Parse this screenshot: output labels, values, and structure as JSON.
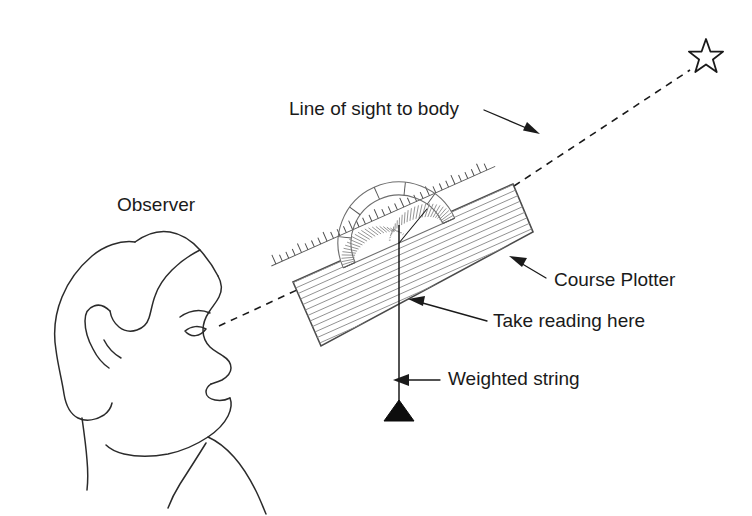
{
  "figure": {
    "background_color": "#ffffff",
    "ink_color": "#1a1a1a",
    "width": 752,
    "height": 516
  },
  "labels": {
    "line_of_sight": "Line of sight to body",
    "observer": "Observer",
    "course_plotter": "Course Plotter",
    "take_reading_here": "Take reading here",
    "weighted_string": "Weighted string"
  },
  "elements": {
    "star": {
      "name": "celestial-body-star",
      "points": 5,
      "center": [
        706,
        57
      ],
      "outer_radius": 18,
      "inner_radius": 7.6
    },
    "observer_head": {
      "name": "observer-head-profile",
      "eye_position": [
        203,
        333
      ],
      "facing": "right"
    },
    "course_plotter": {
      "name": "course-plotter",
      "corners": [
        [
          293,
          282
        ],
        [
          513,
          184
        ],
        [
          533,
          232
        ],
        [
          321,
          346
        ]
      ],
      "rotation_deg": -24,
      "hatch_count": 19,
      "edge_tick_count": 34
    },
    "protractor": {
      "name": "protractor-scale",
      "center": [
        399,
        243
      ],
      "outer_radius": 61,
      "inner_radius": 48,
      "minor_tick_count": 72,
      "sweep": "semicircle"
    },
    "plumb": {
      "name": "weighted-string",
      "top": [
        399,
        226
      ],
      "bottom": [
        399,
        402
      ],
      "weight_apex": [
        399,
        421
      ],
      "weight_half_width": 15
    },
    "sight_line": {
      "name": "line-of-sight-dashed",
      "from": [
        218,
        326
      ],
      "via": [
        296,
        290
      ],
      "to": [
        690,
        70
      ],
      "style": "dashed"
    }
  },
  "leaders": [
    {
      "name": "leader-line-of-sight",
      "label_anchor": [
        290,
        110
      ],
      "start": [
        485,
        110
      ],
      "end": [
        534,
        132
      ]
    },
    {
      "name": "leader-course-plotter",
      "label_anchor": [
        553,
        281
      ],
      "start": [
        545,
        278
      ],
      "end": [
        512,
        258
      ]
    },
    {
      "name": "leader-take-reading",
      "label_anchor": [
        492,
        322
      ],
      "start": [
        485,
        320
      ],
      "end": [
        410,
        299
      ]
    },
    {
      "name": "leader-weighted-string",
      "label_anchor": [
        447,
        380
      ],
      "start": [
        440,
        380
      ],
      "end": [
        394,
        380
      ]
    }
  ],
  "label_positions": {
    "line_of_sight": [
      289,
      110
    ],
    "observer": [
      117,
      206
    ],
    "course_plotter": [
      554,
      281
    ],
    "take_reading_here": [
      493,
      322
    ],
    "weighted_string": [
      448,
      380
    ]
  }
}
